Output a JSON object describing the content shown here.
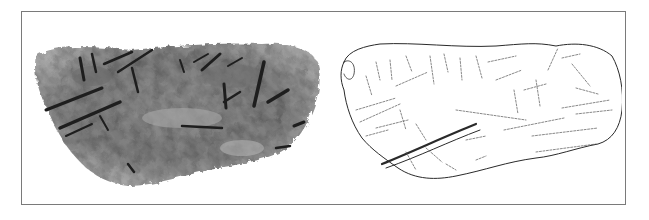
{
  "figure": {
    "panels": [
      {
        "id": "photo",
        "kind": "photograph",
        "tone": "grayscale"
      },
      {
        "id": "drawing",
        "kind": "line-drawing",
        "tone": "black-on-white"
      }
    ],
    "colors": {
      "frame": "#7a7a7a",
      "stone_base": "#8c8c8c",
      "stone_dark": "#4a4a4a",
      "stone_light": "#b8b8b8",
      "incision": "#1e1e1e",
      "drawing_line": "#2a2a2a",
      "background": "#ffffff"
    }
  }
}
